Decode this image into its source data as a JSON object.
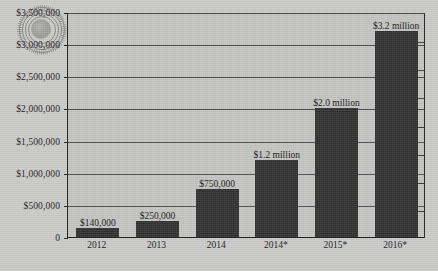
{
  "chart_data": {
    "type": "bar",
    "title": "",
    "subtitle": "",
    "xlabel": "",
    "ylabel": "",
    "categories": [
      "2012",
      "2013",
      "2014",
      "2014*",
      "2015*",
      "2016*"
    ],
    "values": [
      140000,
      250000,
      750000,
      1200000,
      2000000,
      3200000
    ],
    "data_labels": [
      "$140,000",
      "$250,000",
      "$750,000",
      "$1.2 million",
      "$2.0 million",
      "$3.2 million"
    ],
    "ylim": [
      0,
      3500000
    ],
    "ytick_values": [
      0,
      500000,
      1000000,
      1500000,
      2000000,
      2500000,
      3000000,
      3500000
    ],
    "ytick_labels": [
      "0",
      "$500,000",
      "$1,000,000",
      "$1,500,000",
      "$2,000,000",
      "$2,500,000",
      "$3,000,000",
      "$3,500,000"
    ],
    "grid": true,
    "grid_axis": "y",
    "legend": false,
    "legend_position": "none",
    "bar_color": "#2f2f2f",
    "plot_background": "#c2c2c0",
    "figure_background": "#c9c9c7",
    "axis_color": "#1d1d1d",
    "text_color": "#1a1a1a",
    "series": [
      {
        "name": "",
        "values": [
          140000,
          250000,
          750000,
          1200000,
          2000000,
          3200000
        ]
      }
    ]
  },
  "watermark": {
    "name": "circular-stamp-watermark",
    "text": ""
  }
}
